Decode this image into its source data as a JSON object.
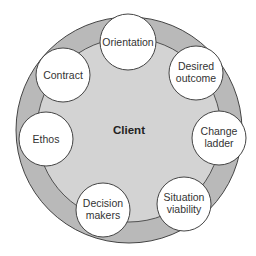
{
  "diagram": {
    "center_label": "Client",
    "colors": {
      "outer_ring": "#b9b9b9",
      "inner_disc": "#d3d3d3",
      "node_fill": "#ffffff",
      "stroke": "#444444"
    },
    "nodes": [
      {
        "lines": [
          "Orientation"
        ],
        "cx": 128,
        "cy": 42
      },
      {
        "lines": [
          "Desired",
          "outcome"
        ],
        "cx": 196,
        "cy": 72
      },
      {
        "lines": [
          "Change",
          "ladder"
        ],
        "cx": 219,
        "cy": 137
      },
      {
        "lines": [
          "Situation",
          "viability"
        ],
        "cx": 184,
        "cy": 203
      },
      {
        "lines": [
          "Decision",
          "makers"
        ],
        "cx": 103,
        "cy": 209
      },
      {
        "lines": [
          "Ethos"
        ],
        "cx": 46,
        "cy": 138
      },
      {
        "lines": [
          "Contract"
        ],
        "cx": 62,
        "cy": 74
      }
    ]
  }
}
